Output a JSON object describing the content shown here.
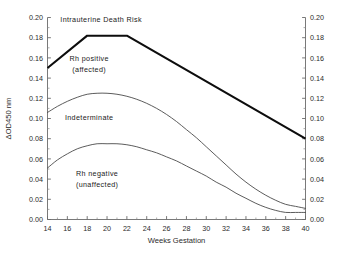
{
  "chart_data": {
    "type": "line",
    "title": "",
    "xlabel": "Weeks Gestation",
    "ylabel": "ΔOD450 nm",
    "ylabel_right": "ΔOD450 nm",
    "xlim": [
      14,
      40
    ],
    "ylim": [
      0.0,
      0.2
    ],
    "xticks": [
      14,
      16,
      18,
      20,
      22,
      24,
      26,
      28,
      30,
      32,
      34,
      36,
      38,
      40
    ],
    "xtick_labels": [
      "14",
      "16",
      "18",
      "20",
      "22",
      "24",
      "26",
      "28",
      "30",
      "32",
      "34",
      "36",
      "38",
      "40"
    ],
    "x_minor_step": 1,
    "yticks": [
      0.0,
      0.02,
      0.04,
      0.06,
      0.08,
      0.1,
      0.12,
      0.14,
      0.16,
      0.18,
      0.2
    ],
    "ytick_labels": [
      "0.00",
      "0.02",
      "0.04",
      "0.06",
      "0.08",
      "0.10",
      "0.12",
      "0.14",
      "0.16",
      "0.18",
      "0.20"
    ],
    "ytick_labels_right": [
      "0.00",
      "0.02",
      "0.04",
      "0.06",
      "0.08",
      "0.10",
      "0.12",
      "0.14",
      "0.16",
      "0.18",
      "0.20"
    ],
    "y_minor_step": 0.01,
    "grid": false,
    "legend": "none",
    "axes_mirrored": true,
    "series": [
      {
        "name": "Intrauterine Death Risk boundary",
        "style": "thick",
        "color": "#0d0d0d",
        "x": [
          14,
          18,
          22,
          40
        ],
        "values": [
          0.15,
          0.182,
          0.182,
          0.08
        ]
      },
      {
        "name": "Rh positive (affected) lower boundary",
        "style": "thin",
        "color": "#4a4a4a",
        "x": [
          14,
          15,
          16,
          17,
          18,
          19,
          20,
          21,
          22,
          23,
          24,
          25,
          26,
          27,
          28,
          29,
          30,
          31,
          32,
          33,
          34,
          35,
          36,
          37,
          38,
          39,
          40
        ],
        "values": [
          0.106,
          0.112,
          0.117,
          0.121,
          0.124,
          0.125,
          0.125,
          0.124,
          0.122,
          0.119,
          0.115,
          0.11,
          0.104,
          0.097,
          0.089,
          0.081,
          0.072,
          0.063,
          0.054,
          0.045,
          0.037,
          0.03,
          0.024,
          0.019,
          0.015,
          0.013,
          0.011
        ]
      },
      {
        "name": "Indeterminate lower boundary",
        "style": "thin",
        "color": "#4a4a4a",
        "x": [
          14,
          15,
          16,
          17,
          18,
          19,
          20,
          21,
          22,
          23,
          24,
          25,
          26,
          27,
          28,
          29,
          30,
          31,
          32,
          33,
          34,
          35,
          36,
          37,
          38,
          39,
          40
        ],
        "values": [
          0.051,
          0.059,
          0.065,
          0.07,
          0.073,
          0.075,
          0.075,
          0.075,
          0.074,
          0.072,
          0.069,
          0.066,
          0.062,
          0.058,
          0.053,
          0.048,
          0.043,
          0.037,
          0.032,
          0.026,
          0.021,
          0.016,
          0.012,
          0.009,
          0.007,
          0.007,
          0.007
        ]
      }
    ],
    "annotations": [
      {
        "id": "death-risk",
        "text": "Intrauterine Death Risk",
        "x": 19.4,
        "y": 0.196
      },
      {
        "id": "rh-positive-1",
        "text": "Rh positive",
        "x": 18.2,
        "y": 0.157
      },
      {
        "id": "rh-positive-2",
        "text": "(affected)",
        "x": 18.2,
        "y": 0.146
      },
      {
        "id": "indeterminate",
        "text": "Indeterminate",
        "x": 18.2,
        "y": 0.099
      },
      {
        "id": "rh-negative-1",
        "text": "Rh negative",
        "x": 19.0,
        "y": 0.043
      },
      {
        "id": "rh-negative-2",
        "text": "(unaffected)",
        "x": 19.0,
        "y": 0.032
      }
    ]
  }
}
